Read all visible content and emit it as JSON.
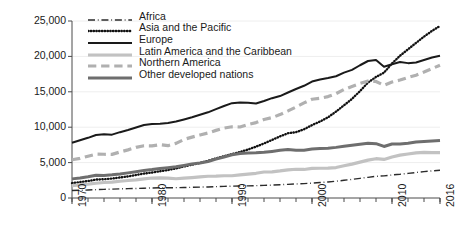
{
  "chart_data": {
    "type": "line",
    "title": "",
    "xlabel": "",
    "ylabel": "Constant 2010 USD (billions)",
    "xlim": [
      1970,
      2016
    ],
    "ylim": [
      0,
      25000
    ],
    "ytick_labels": [
      "0",
      "5,000",
      "10,000",
      "15,000",
      "20,000",
      "25,000"
    ],
    "ytick_values": [
      0,
      5000,
      10000,
      15000,
      20000,
      25000
    ],
    "xtick_labels": [
      "1970",
      "1980",
      "1990",
      "2000",
      "2010",
      "2016"
    ],
    "xtick_values": [
      1970,
      1980,
      1990,
      2000,
      2010,
      2016
    ],
    "xminor_step": 2,
    "grid": "horizontal-faint",
    "legend_position": "top-left-inside",
    "x": [
      1970,
      1971,
      1972,
      1973,
      1974,
      1975,
      1976,
      1977,
      1978,
      1979,
      1980,
      1981,
      1982,
      1983,
      1984,
      1985,
      1986,
      1987,
      1988,
      1989,
      1990,
      1991,
      1992,
      1993,
      1994,
      1995,
      1996,
      1997,
      1998,
      1999,
      2000,
      2001,
      2002,
      2003,
      2004,
      2005,
      2006,
      2007,
      2008,
      2009,
      2010,
      2011,
      2012,
      2013,
      2014,
      2015,
      2016
    ],
    "series": [
      {
        "name": "Africa",
        "style": "dashdot",
        "color": "#2b2b2b",
        "width": 1.4,
        "values": [
          1050,
          1090,
          1130,
          1180,
          1220,
          1250,
          1290,
          1320,
          1340,
          1380,
          1420,
          1440,
          1450,
          1460,
          1480,
          1510,
          1540,
          1560,
          1600,
          1640,
          1670,
          1690,
          1710,
          1740,
          1780,
          1820,
          1880,
          1930,
          1980,
          2030,
          2100,
          2180,
          2270,
          2370,
          2500,
          2630,
          2770,
          2920,
          3060,
          3130,
          3250,
          3350,
          3480,
          3600,
          3720,
          3830,
          3910
        ]
      },
      {
        "name": "Asia and the Pacific",
        "style": "dotted",
        "color": "#111111",
        "width": 2.4,
        "values": [
          2100,
          2250,
          2400,
          2600,
          2650,
          2750,
          2900,
          3050,
          3250,
          3450,
          3600,
          3780,
          3950,
          4180,
          4450,
          4700,
          4950,
          5250,
          5600,
          5900,
          6200,
          6500,
          6850,
          7250,
          7700,
          8200,
          8700,
          9150,
          9300,
          9700,
          10300,
          10800,
          11400,
          12200,
          13100,
          14000,
          15100,
          16300,
          17100,
          17700,
          19000,
          20100,
          21000,
          21900,
          22800,
          23600,
          24300
        ]
      },
      {
        "name": "Europe",
        "style": "solid",
        "color": "#1a1a1a",
        "width": 2.0,
        "values": [
          7800,
          8150,
          8500,
          8900,
          9000,
          8950,
          9300,
          9600,
          9950,
          10300,
          10450,
          10500,
          10600,
          10800,
          11100,
          11400,
          11750,
          12100,
          12550,
          13000,
          13400,
          13500,
          13450,
          13350,
          13700,
          14100,
          14400,
          14900,
          15400,
          15850,
          16450,
          16750,
          16950,
          17200,
          17700,
          18100,
          18750,
          19350,
          19500,
          18550,
          18900,
          19200,
          19050,
          19150,
          19500,
          19850,
          20100
        ]
      },
      {
        "name": "Latin America and the Caribbean",
        "style": "solid",
        "color": "#c2c2c2",
        "width": 3.2,
        "values": [
          1750,
          1850,
          1950,
          2080,
          2190,
          2250,
          2370,
          2470,
          2560,
          2700,
          2820,
          2850,
          2810,
          2720,
          2800,
          2890,
          2990,
          3070,
          3090,
          3140,
          3140,
          3270,
          3370,
          3490,
          3670,
          3700,
          3820,
          3980,
          4060,
          4030,
          4180,
          4200,
          4220,
          4300,
          4550,
          4790,
          5060,
          5350,
          5550,
          5450,
          5800,
          6050,
          6220,
          6380,
          6450,
          6420,
          6400
        ]
      },
      {
        "name": "Northern America",
        "style": "dashed",
        "color": "#b0b0b0",
        "width": 3.2,
        "values": [
          5400,
          5600,
          5900,
          6200,
          6180,
          6160,
          6500,
          6800,
          7150,
          7380,
          7360,
          7540,
          7390,
          7720,
          8270,
          8600,
          8900,
          9180,
          9550,
          9880,
          10060,
          10030,
          10370,
          10650,
          11080,
          11350,
          11780,
          12300,
          12850,
          13430,
          13950,
          14080,
          14320,
          14740,
          15320,
          15760,
          16180,
          16510,
          16460,
          15930,
          16380,
          16660,
          17030,
          17340,
          17790,
          18280,
          18750
        ]
      },
      {
        "name": "Other developed nations",
        "style": "solid",
        "color": "#6e6e6e",
        "width": 3.0,
        "values": [
          2700,
          2830,
          2990,
          3220,
          3190,
          3280,
          3400,
          3550,
          3720,
          3900,
          4020,
          4180,
          4280,
          4400,
          4600,
          4820,
          4950,
          5150,
          5500,
          5800,
          6100,
          6300,
          6350,
          6380,
          6450,
          6580,
          6730,
          6840,
          6760,
          6750,
          6930,
          6980,
          7040,
          7150,
          7310,
          7460,
          7590,
          7720,
          7680,
          7280,
          7620,
          7620,
          7740,
          7900,
          7970,
          8050,
          8130
        ]
      }
    ]
  }
}
